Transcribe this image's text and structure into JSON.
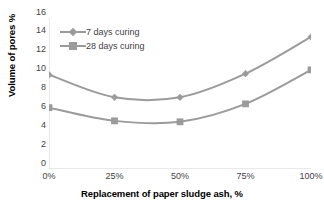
{
  "chart_data": {
    "type": "line",
    "title": "",
    "categories": [
      "0%",
      "25%",
      "50%",
      "75%",
      "100%"
    ],
    "xlabel": "Replacement of paper sludge ash, %",
    "ylabel": "Volume of pores %",
    "ylim": [
      0,
      16
    ],
    "ytick_step": 2,
    "yticks": [
      "16",
      "14",
      "12",
      "10",
      "8",
      "6",
      "4",
      "2",
      "0"
    ],
    "grid": false,
    "legend_position": "top-left",
    "series": [
      {
        "name": "7 days curing",
        "marker": "diamond",
        "color": "#9b9b9b",
        "values": [
          10.0,
          7.6,
          7.6,
          10.1,
          14.0
        ]
      },
      {
        "name": "28 days curing",
        "marker": "square",
        "color": "#9b9b9b",
        "values": [
          6.5,
          5.1,
          5.0,
          6.9,
          10.5
        ]
      }
    ]
  },
  "style": {
    "line_color": "#9b9b9b",
    "axis_color": "#d2d2d2",
    "tick_text_color": "#3f3f3f",
    "title_color": "#000000",
    "background": "#ffffff"
  }
}
